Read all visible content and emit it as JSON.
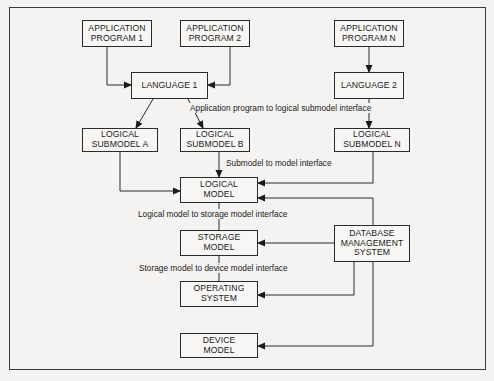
{
  "diagram": {
    "boxes": {
      "app1": "APPLICATION\nPROGRAM 1",
      "app2": "APPLICATION\nPROGRAM 2",
      "appN": "APPLICATION\nPROGRAM N",
      "lang1": "LANGUAGE 1",
      "lang2": "LANGUAGE 2",
      "subA": "LOGICAL\nSUBMODEL A",
      "subB": "LOGICAL\nSUBMODEL B",
      "subN": "LOGICAL\nSUBMODEL N",
      "logical": "LOGICAL\nMODEL",
      "storage": "STORAGE\nMODEL",
      "dbms": "DATABASE\nMANAGEMENT\nSYSTEM",
      "os": "OPERATING\nSYSTEM",
      "device": "DEVICE\nMODEL"
    },
    "interfaces": {
      "app_to_sub": "Application program to logical submodel interface",
      "sub_to_model": "Submodel to model interface",
      "logical_to_storage": "Logical model to storage model interface",
      "storage_to_device": "Storage model to device model interface"
    },
    "colors": {
      "line": "#2a2a2a",
      "background": "#f4f3f1"
    }
  }
}
